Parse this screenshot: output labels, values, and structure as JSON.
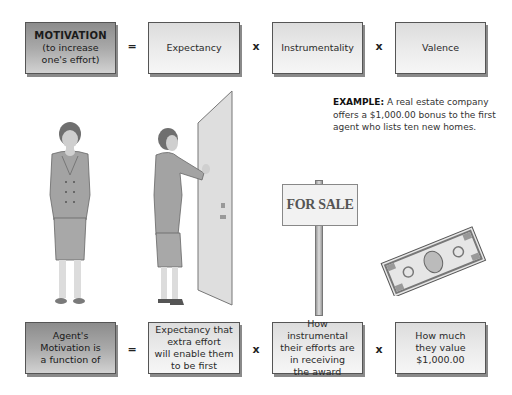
{
  "equation_top": {
    "motivation": {
      "title": "MOTIVATION",
      "subtitle_line1": "(to increase",
      "subtitle_line2": "one's effort)"
    },
    "equals": "=",
    "times": "x",
    "expectancy": "Expectancy",
    "instrumentality": "Instrumentality",
    "valence": "Valence"
  },
  "example": {
    "label": "EXAMPLE:",
    "text": " A real estate company offers a $1,000.00 bonus to the first agent who lists ten new homes."
  },
  "illustrations": {
    "sign_text": "FOR SALE",
    "figures": [
      "thinking-woman",
      "woman-at-door",
      "for-sale-sign",
      "thousand-dollar-bill"
    ]
  },
  "equation_bottom": {
    "agent": [
      "Agent's",
      "Motivation is",
      "a function of"
    ],
    "equals": "=",
    "times": "x",
    "expectancy": [
      "Expectancy that",
      "extra effort",
      "will enable them",
      "to be first"
    ],
    "instrumentality": [
      "How instrumental",
      "their efforts are",
      "in receiving",
      "the award"
    ],
    "valence": [
      "How much",
      "they value",
      "$1,000.00"
    ]
  },
  "colors": {
    "dark_box": "#a9a9a9",
    "light_box": "#ececec",
    "border": "#555555"
  }
}
